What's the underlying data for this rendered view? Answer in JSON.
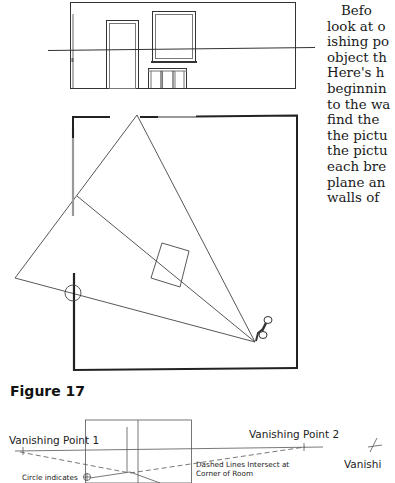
{
  "body_text": {
    "lines": [
      "Befo",
      "look at o",
      "ishing po",
      "object th",
      "Here's h",
      "beginnin",
      "to the wa",
      "find the",
      "the pictu",
      "the pictu",
      "each bre",
      "plane an",
      "walls of"
    ]
  },
  "figure": {
    "label": "Figure 17",
    "elevation_view": "wall-elevation-with-door-window-and-horizon-line",
    "plan_view": "room-plan-with-viewing-cone-and-pushpin",
    "perspective_view": {
      "vp1_label": "Vanishing Point 1",
      "vp2_label": "Vanishing Point 2",
      "circle_label": "Circle indicates",
      "dashed_label_line1": "Dashed Lines Intersect at",
      "dashed_label_line2": "Corner of Room",
      "cutoff_label": "Vanishi",
      "cutoff_label2": "f  t f"
    }
  }
}
